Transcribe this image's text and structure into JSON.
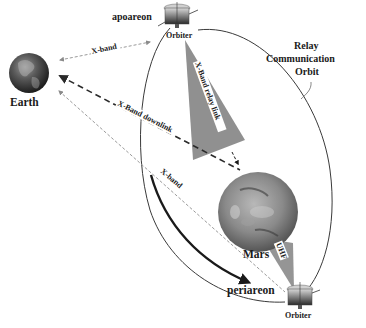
{
  "diagram": {
    "nodes": {
      "earth": {
        "label": "Earth"
      },
      "mars": {
        "label": "Mars"
      },
      "orbiter_apoareon": {
        "label": "Orbiter",
        "position_label": "apoareon"
      },
      "orbiter_periareon": {
        "label": "Orbiter",
        "position_label": "periareon"
      }
    },
    "orbit": {
      "label_line1": "Relay",
      "label_line2": "Communication",
      "label_line3": "Orbit"
    },
    "links": {
      "earth_apoareon": {
        "label": "X-band",
        "style": "dashed-light"
      },
      "downlink": {
        "label": "X-Band downlink",
        "style": "dashed-heavy"
      },
      "relay": {
        "label": "X-Band relay link",
        "style": "filled-cone"
      },
      "earth_periareon": {
        "label": "X-band",
        "style": "dashed-light"
      },
      "uhf": {
        "label": "UHF",
        "style": "filled-cone"
      }
    },
    "colors": {
      "cone": "#8a8a8a",
      "orbit_line": "#3a3a3a",
      "light_dash": "#9a9a9a",
      "heavy_dash": "#2a2a2a",
      "text": "#1a1a1a"
    }
  }
}
